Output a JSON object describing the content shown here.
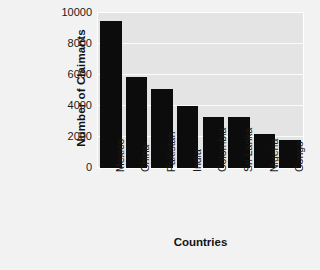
{
  "chart_data": {
    "type": "bar",
    "title": "",
    "xlabel": "Countries",
    "ylabel": "Number of Claimants",
    "categories": [
      "Mexico",
      "China",
      "Pakistan",
      "India",
      "Colombia",
      "Sri Lanka",
      "Nigeria",
      "Congo"
    ],
    "values": [
      9500,
      5900,
      5100,
      4000,
      3300,
      3300,
      2200,
      1800
    ],
    "ylim": [
      0,
      10000
    ],
    "yticks": [
      0,
      2000,
      4000,
      6000,
      8000,
      10000
    ],
    "ytick_labels": [
      "0",
      "2000",
      "4000",
      "6000",
      "8000",
      "10000"
    ],
    "grid": true,
    "legend": "none",
    "bar_color": "#0c0c0c",
    "plot_background": "#e4e4e4",
    "figure_background": "#f2f2f2",
    "gridline_color": "#fbfbfb"
  }
}
